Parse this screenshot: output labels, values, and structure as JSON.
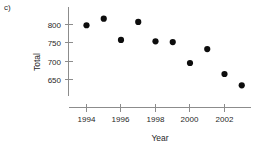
{
  "panel": {
    "label": "c)"
  },
  "chart_data": {
    "type": "scatter",
    "title": "",
    "xlabel": "Year",
    "ylabel": "Total",
    "x": [
      1994,
      1995,
      1996,
      1997,
      1998,
      1999,
      2000,
      2001,
      2002,
      2003
    ],
    "values": [
      798,
      816,
      758,
      807,
      754,
      752,
      695,
      733,
      665,
      634
    ],
    "series": [
      {
        "name": "Total",
        "x": [
          1994,
          1995,
          1996,
          1997,
          1998,
          1999,
          2000,
          2001,
          2002,
          2003
        ],
        "values": [
          798,
          816,
          758,
          807,
          754,
          752,
          695,
          733,
          665,
          634
        ]
      }
    ],
    "xticks": [
      1994,
      1996,
      1998,
      2000,
      2002
    ],
    "xticklabels": [
      "1994",
      "1996",
      "1998",
      "2000",
      "2002"
    ],
    "yticks": [
      650,
      700,
      750,
      800
    ],
    "yticklabels": [
      "650",
      "700",
      "750",
      "800"
    ],
    "xlim": [
      1993.0,
      2004.2
    ],
    "ylim": [
      612,
      828
    ],
    "grid": false,
    "legend": false,
    "marker": "filled-circle",
    "marker_color": "#0d0d0d",
    "axis_color": "#8c8c8c"
  }
}
